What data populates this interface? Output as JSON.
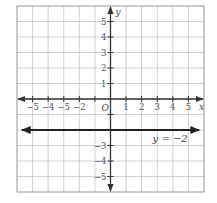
{
  "chart_data": {
    "type": "line",
    "title": "",
    "xlabel": "x",
    "ylabel": "y",
    "xlim": [
      -6,
      6
    ],
    "ylim": [
      -6,
      6
    ],
    "grid": true,
    "origin_label": "O",
    "x_tick_labels": [
      {
        "value": -5,
        "label": "−5"
      },
      {
        "value": -4,
        "label": "−4"
      },
      {
        "value": -3,
        "label": "−5"
      },
      {
        "value": -2,
        "label": "−2"
      },
      {
        "value": 1,
        "label": "1"
      },
      {
        "value": 2,
        "label": "2"
      },
      {
        "value": 3,
        "label": "3"
      },
      {
        "value": 4,
        "label": "4"
      },
      {
        "value": 5,
        "label": "5"
      }
    ],
    "y_tick_labels": [
      {
        "value": 5,
        "label": "5"
      },
      {
        "value": 4,
        "label": "4"
      },
      {
        "value": 3,
        "label": "3"
      },
      {
        "value": 2,
        "label": "2"
      },
      {
        "value": 1,
        "label": "1"
      },
      {
        "value": -3,
        "label": "−3"
      },
      {
        "value": -4,
        "label": "−4"
      },
      {
        "value": -5,
        "label": "−5"
      }
    ],
    "series": [
      {
        "name": "y = −2",
        "label": "y = −2",
        "x": [
          -5.5,
          5.5
        ],
        "y": [
          -2,
          -2
        ],
        "arrows_both_ends": true,
        "color": "#222222"
      }
    ],
    "annotations": [
      {
        "text": "y = −2",
        "x": 2.7,
        "y": -2.6
      }
    ]
  },
  "colors": {
    "grid": "#bdbdbd",
    "axis": "#333333",
    "line": "#222222",
    "border": "#9e9e9e"
  }
}
